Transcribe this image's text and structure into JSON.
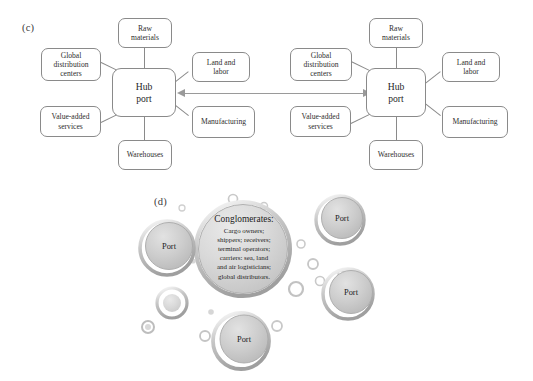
{
  "figure": {
    "panels": [
      {
        "id": "c",
        "label": "(c)"
      },
      {
        "id": "d",
        "label": "(d)"
      }
    ]
  },
  "panel_c": {
    "label": "(c)",
    "diagrams": [
      {
        "name": "left-hub-network",
        "hub": {
          "line1": "Hub",
          "line2": "port"
        },
        "nodes": [
          {
            "key": "raw-materials",
            "line1": "Raw",
            "line2": "materials"
          },
          {
            "key": "global-distribution",
            "line1": "Global",
            "line2": "distribution",
            "line3": "centers"
          },
          {
            "key": "land-and-labor",
            "line1": "Land and",
            "line2": "labor"
          },
          {
            "key": "manufacturing",
            "line1": "Manufacturing"
          },
          {
            "key": "value-added-services",
            "line1": "Value-added",
            "line2": "services"
          },
          {
            "key": "warehouses",
            "line1": "Warehouses"
          }
        ]
      },
      {
        "name": "right-hub-network",
        "hub": {
          "line1": "Hub",
          "line2": "port"
        },
        "nodes": [
          {
            "key": "raw-materials",
            "line1": "Raw",
            "line2": "materials"
          },
          {
            "key": "global-distribution",
            "line1": "Global",
            "line2": "distribution",
            "line3": "centers"
          },
          {
            "key": "land-and-labor",
            "line1": "Land and",
            "line2": "labor"
          },
          {
            "key": "manufacturing",
            "line1": "Manufacturing"
          },
          {
            "key": "value-added-services",
            "line1": "Value-added",
            "line2": "services"
          },
          {
            "key": "warehouses",
            "line1": "Warehouses"
          }
        ]
      }
    ],
    "connector_arrow": {
      "style": "double-headed",
      "color": "#9a9a9a"
    }
  },
  "panel_d": {
    "label": "(d)",
    "central_bubble": {
      "heading": "Conglomerates:",
      "body_lines": [
        "Cargo owners;",
        "shippers; receivers;",
        "terminal operators;",
        "carriers: sea, land",
        "and air logisticians;",
        "global distributors."
      ]
    },
    "port_bubbles": [
      {
        "key": "port-left",
        "label": "Port"
      },
      {
        "key": "port-top-right",
        "label": "Port"
      },
      {
        "key": "port-right",
        "label": "Port"
      },
      {
        "key": "port-bottom",
        "label": "Port"
      }
    ]
  },
  "colors": {
    "box_border": "#8a8a8a",
    "connector": "#8a8a8a",
    "arrow": "#9a9a9a",
    "bubble_fill": "#c9c9c9",
    "bubble_ring": "#b2b2b2",
    "text": "#1d1d1d",
    "background": "#ffffff"
  }
}
